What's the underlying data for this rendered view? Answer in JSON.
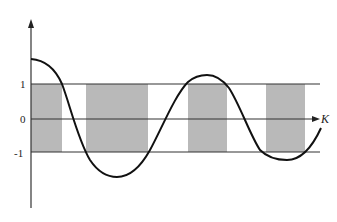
{
  "diagram": {
    "type": "band-structure-plot",
    "colors": {
      "band_fill": "#b9b9b9",
      "line": "#333333",
      "curve": "#111111",
      "background": "#ffffff"
    },
    "y_axis": {
      "labels": [
        {
          "text": "1",
          "value": 1
        },
        {
          "text": "0",
          "value": 0
        },
        {
          "text": "-1",
          "value": -1
        }
      ]
    },
    "x_axis": {
      "label": "K"
    },
    "horizontal_lines": [
      1,
      0,
      -1
    ],
    "shaded_bands": [
      {
        "x_start": 31,
        "x_end": 62
      },
      {
        "x_start": 86,
        "x_end": 148
      },
      {
        "x_start": 188,
        "x_end": 227
      },
      {
        "x_start": 266,
        "x_end": 305
      }
    ],
    "curve": {
      "description": "Damped oscillating function starting above 1 at K=0, crossing the band limits ±1",
      "extrema": [
        {
          "x": 31,
          "y_px": 59,
          "kind": "start"
        },
        {
          "x": 117,
          "y_px": 177,
          "kind": "min"
        },
        {
          "x": 207,
          "y_px": 75,
          "kind": "max"
        },
        {
          "x": 287,
          "y_px": 160,
          "kind": "min"
        },
        {
          "x": 321,
          "y_px": 128,
          "kind": "end"
        }
      ]
    }
  }
}
